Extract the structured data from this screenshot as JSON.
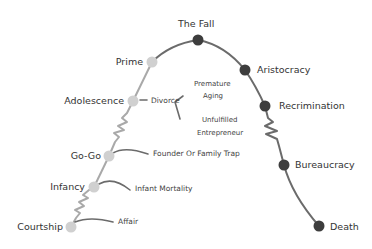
{
  "diagram": {
    "type": "lifecycle-curve",
    "colors": {
      "curve": "#6b6b6b",
      "growth_node": "#d0d0d0",
      "decline_node": "#3d3d3d",
      "risk_line": "#666666",
      "text": "#333333"
    },
    "growth_stages": [
      {
        "label": "Courtship"
      },
      {
        "label": "Infancy"
      },
      {
        "label": "Go-Go"
      },
      {
        "label": "Adolescence"
      },
      {
        "label": "Prime"
      }
    ],
    "decline_stages": [
      {
        "label": "The Fall"
      },
      {
        "label": "Aristocracy"
      },
      {
        "label": "Recrimination"
      },
      {
        "label": "Bureaucracy"
      },
      {
        "label": "Death"
      }
    ],
    "traps": {
      "courtship": "Affair",
      "infancy": "Infant Mortality",
      "gogo": "Founder Or Family Trap",
      "adolescence": "Divorce",
      "divorce_branches": {
        "upper_line1": "Premature",
        "upper_line2": "Aging",
        "lower_line1": "Unfulfilled",
        "lower_line2": "Entrepreneur"
      }
    }
  }
}
